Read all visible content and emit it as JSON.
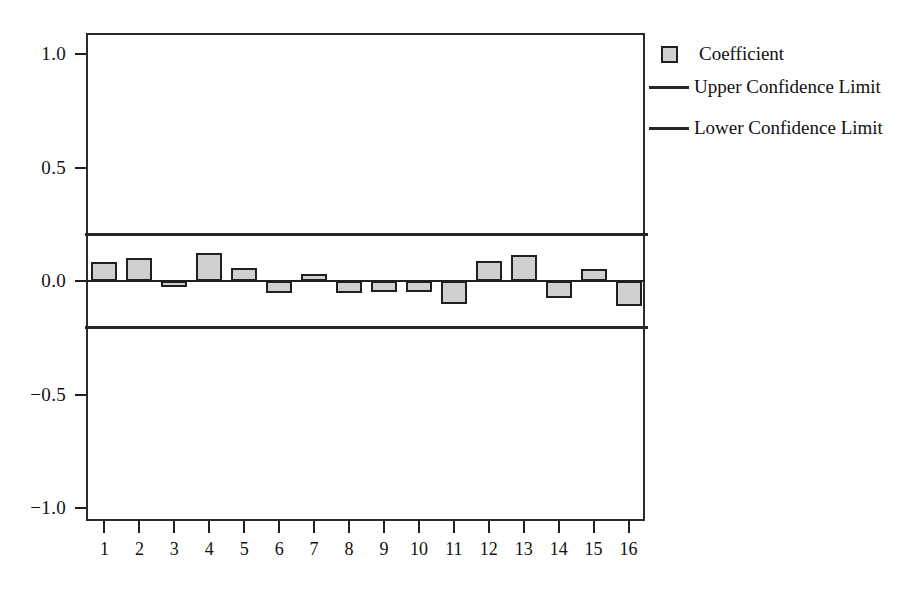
{
  "chart_data": {
    "type": "bar",
    "title": "",
    "subtitle": "",
    "xlabel": "",
    "ylabel": "",
    "categories": [
      "1",
      "2",
      "3",
      "4",
      "5",
      "6",
      "7",
      "8",
      "9",
      "10",
      "11",
      "12",
      "13",
      "14",
      "15",
      "16"
    ],
    "series": [
      {
        "name": "Coefficient",
        "values": [
          0.084,
          0.101,
          -0.01,
          0.124,
          0.057,
          -0.053,
          0.031,
          -0.053,
          -0.049,
          -0.049,
          -0.101,
          0.088,
          0.114,
          -0.075,
          0.053,
          -0.11
        ]
      }
    ],
    "reference_lines": [
      {
        "name": "Upper Confidence Limit",
        "value": 0.207,
        "x_start_category": 1,
        "x_end_category": 16
      },
      {
        "name": "Lower Confidence Limit",
        "value": -0.203,
        "x_start_category": 1,
        "x_end_category": 16
      }
    ],
    "ylim": [
      -1.15,
      1.15
    ],
    "yticks": [
      1.0,
      0.5,
      0.0,
      -0.5,
      -1.0
    ],
    "ytick_labels": [
      "1.0",
      "0.5",
      "0.0",
      "−0.5",
      "−1.0"
    ],
    "xticks": [
      1,
      2,
      3,
      4,
      5,
      6,
      7,
      8,
      9,
      10,
      11,
      12,
      13,
      14,
      15,
      16
    ],
    "grid": false,
    "legend_position": "right-top"
  },
  "legend": {
    "entries": [
      {
        "label": "Coefficient",
        "marker": "box",
        "color": "#cfcfcf"
      },
      {
        "label": "Upper Confidence Limit",
        "marker": "line",
        "color": "#262626"
      },
      {
        "label": "Lower Confidence Limit",
        "marker": "line",
        "color": "#262626"
      }
    ]
  },
  "colors": {
    "bar_fill": "#cfcfcf",
    "bar_stroke": "#1f1f1f",
    "axis": "#1f1f1f",
    "confidence_line": "#262626",
    "background": "#ffffff"
  }
}
